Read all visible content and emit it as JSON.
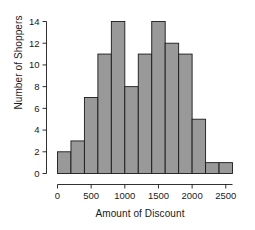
{
  "chart_data": {
    "type": "bar",
    "title": "",
    "xlabel": "Amount of Discount",
    "ylabel": "Number of Shoppers",
    "bin_width": 200,
    "bin_edges": [
      0,
      200,
      400,
      600,
      800,
      1000,
      1200,
      1400,
      1600,
      1800,
      2000,
      2200,
      2400,
      2600
    ],
    "categories": [
      "0-200",
      "200-400",
      "400-600",
      "600-800",
      "800-1000",
      "1000-1200",
      "1200-1400",
      "1400-1600",
      "1600-1800",
      "1800-2000",
      "2000-2200",
      "2200-2400",
      "2400-2600"
    ],
    "values": [
      2,
      3,
      7,
      11,
      14,
      8,
      11,
      14,
      12,
      11,
      5,
      1,
      1
    ],
    "x": [
      100,
      300,
      500,
      700,
      900,
      1100,
      1300,
      1500,
      1700,
      1900,
      2100,
      2300,
      2500
    ],
    "xlim": [
      0,
      2600
    ],
    "ylim": [
      0,
      14
    ],
    "xticks": [
      0,
      500,
      1000,
      1500,
      2000,
      2500
    ],
    "xtick_labels": [
      "0",
      "500",
      "1000",
      "1500",
      "2000",
      "2500"
    ],
    "yticks": [
      0,
      2,
      4,
      6,
      8,
      10,
      12,
      14
    ],
    "ytick_labels": [
      "0",
      "2",
      "4",
      "6",
      "8",
      "10",
      "12",
      "14"
    ],
    "grid": false,
    "legend": false,
    "bar_fill_color": "#999999",
    "bar_edge_color": "#1a1a1a",
    "axis_color": "#1a1a1a",
    "background_color": "#ffffff"
  }
}
